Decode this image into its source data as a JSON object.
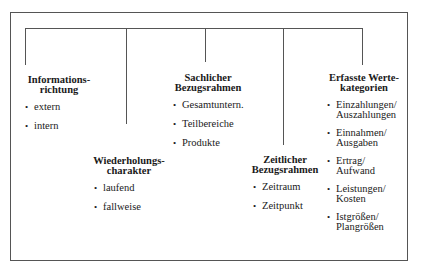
{
  "diagram": {
    "type": "tree",
    "groups": [
      {
        "id": "informationsrichtung",
        "title_lines": [
          "Informations-",
          "richtung"
        ],
        "items": [
          [
            "extern"
          ],
          [
            "intern"
          ]
        ]
      },
      {
        "id": "wiederholungscharakter",
        "title_lines": [
          "Wiederholungs-",
          "charakter"
        ],
        "items": [
          [
            "laufend"
          ],
          [
            "fallweise"
          ]
        ]
      },
      {
        "id": "sachlicher-bezugsrahmen",
        "title_lines": [
          "Sachlicher",
          "Bezugsrahmen"
        ],
        "items": [
          [
            "Gesamtuntern."
          ],
          [
            "Teilbereiche"
          ],
          [
            "Produkte"
          ]
        ]
      },
      {
        "id": "zeitlicher-bezugsrahmen",
        "title_lines": [
          "Zeitlicher",
          "Bezugsrahmen"
        ],
        "items": [
          [
            "Zeitraum"
          ],
          [
            "Zeitpunkt"
          ]
        ]
      },
      {
        "id": "erfasste-wertekategorien",
        "title_lines": [
          "Erfasste Werte-",
          "kategorien"
        ],
        "items": [
          [
            "Einzahlungen/",
            "Auszahlungen"
          ],
          [
            "Einnahmen/",
            "Ausgaben"
          ],
          [
            "Ertrag/",
            "Aufwand"
          ],
          [
            "Leistungen/",
            "Kosten"
          ],
          [
            "Istgrößen/",
            "Plangrößen"
          ]
        ]
      }
    ],
    "bullet": "•",
    "colors": {
      "line": "#555555",
      "text": "#1a1a1a",
      "background": "#ffffff"
    }
  }
}
